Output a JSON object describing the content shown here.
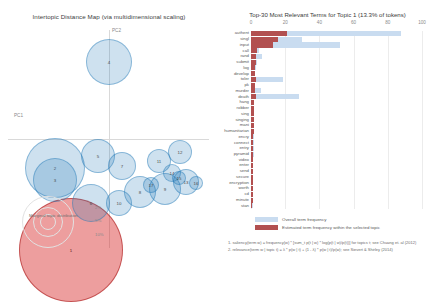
{
  "left_panel": {
    "title": "Intertopic Distance Map (via multidimensional scaling)",
    "axis": {
      "x_label": "PC1",
      "y_label": "PC2"
    },
    "marginal_legend": {
      "label": "Marginal topic distribution",
      "sizes": [
        "2%",
        "5%",
        "10%"
      ]
    },
    "topics": [
      {
        "id": "1",
        "x": 71,
        "y": 250,
        "r": 52,
        "selected": true
      },
      {
        "id": "2",
        "x": 55,
        "y": 168,
        "r": 30,
        "selected": false
      },
      {
        "id": "3",
        "x": 55,
        "y": 180,
        "r": 22,
        "selected": false
      },
      {
        "id": "4",
        "x": 109,
        "y": 62,
        "r": 23,
        "selected": false
      },
      {
        "id": "5",
        "x": 98,
        "y": 156,
        "r": 17,
        "selected": false
      },
      {
        "id": "6",
        "x": 91,
        "y": 203,
        "r": 19,
        "selected": false
      },
      {
        "id": "7",
        "x": 122,
        "y": 166,
        "r": 14,
        "selected": false
      },
      {
        "id": "8",
        "x": 140,
        "y": 192,
        "r": 16,
        "selected": false
      },
      {
        "id": "9",
        "x": 165,
        "y": 189,
        "r": 16,
        "selected": false
      },
      {
        "id": "10",
        "x": 119,
        "y": 203,
        "r": 13,
        "selected": false
      },
      {
        "id": "11",
        "x": 159,
        "y": 161,
        "r": 12,
        "selected": false
      },
      {
        "id": "12",
        "x": 180,
        "y": 152,
        "r": 12,
        "selected": false
      },
      {
        "id": "13",
        "x": 186,
        "y": 182,
        "r": 13,
        "selected": false
      },
      {
        "id": "14",
        "x": 172,
        "y": 173,
        "r": 9,
        "selected": false
      },
      {
        "id": "15",
        "x": 179,
        "y": 178,
        "r": 7,
        "selected": false
      },
      {
        "id": "16",
        "x": 196,
        "y": 183,
        "r": 7,
        "selected": false
      },
      {
        "id": "17",
        "x": 151,
        "y": 185,
        "r": 8,
        "selected": false
      }
    ]
  },
  "right_panel": {
    "title": "Top-30 Most Relevant Terms for Topic 1 (13.3% of tokens)",
    "legend": {
      "overall_label": "Overall term frequency",
      "topic_label": "Estimated term frequency within the selected topic"
    },
    "footnotes": [
      "1. saliency(term w) = frequency(w) * [sum_t p(t | w) * log(p(t | w)/p(t))] for topics t; see Chuang et. al (2012)",
      "2. relevance(term w | topic t) = λ * p(w | t) + (1 - λ) * p(w | t)/p(w); see Sievert & Shirley (2014)"
    ]
  },
  "chart_data": {
    "type": "bar",
    "title": "Top-30 Most Relevant Terms for Topic 1 (13.3% of tokens)",
    "xlabel": "",
    "ylabel": "",
    "xlim": [
      0,
      100
    ],
    "xticks": [
      0,
      20,
      40,
      60,
      80,
      100
    ],
    "grid": true,
    "legend_position": "bottom-left",
    "orientation": "horizontal",
    "categories": [
      "authent",
      "singl",
      "input",
      "call",
      "rand",
      "submit",
      "log",
      "develop",
      "toler",
      "pk",
      "murder",
      "death",
      "hang",
      "robber",
      "sing",
      "singing",
      "mani",
      "humanitarian",
      "encry",
      "connect",
      "entry",
      "pyramid",
      "video",
      "enter",
      "send",
      "secure",
      "encryption",
      "worth",
      "cd",
      "minute",
      "stan"
    ],
    "series": [
      {
        "name": "Overall term frequency",
        "color": "#c9dcf0",
        "values": [
          88,
          30,
          52,
          4.5,
          6.5,
          3.5,
          3.0,
          2.5,
          19,
          2.6,
          6.0,
          28,
          2.0,
          1.9,
          1.8,
          1.8,
          1.7,
          1.7,
          1.6,
          1.6,
          1.5,
          1.5,
          1.4,
          1.4,
          1.3,
          1.3,
          1.2,
          1.2,
          1.1,
          1.1,
          1.0
        ]
      },
      {
        "name": "Estimated term frequency within the selected topic",
        "color": "#b25050",
        "values": [
          21,
          16,
          13,
          3.6,
          3.0,
          2.8,
          2.5,
          2.2,
          3.0,
          2.2,
          2.4,
          3.2,
          1.8,
          1.7,
          1.6,
          1.6,
          1.5,
          1.5,
          1.4,
          1.4,
          1.3,
          1.3,
          1.2,
          1.2,
          1.1,
          1.1,
          1.0,
          1.0,
          0.9,
          0.9,
          0.8
        ]
      }
    ]
  }
}
